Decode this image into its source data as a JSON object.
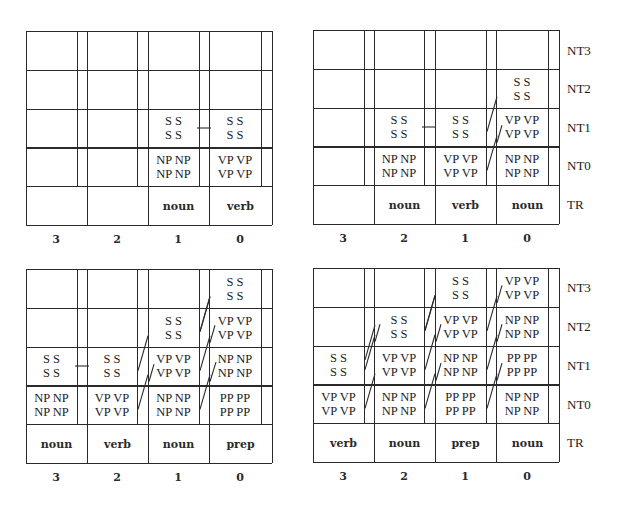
{
  "row_labels": [
    "NT3",
    "NT2",
    "NT1",
    "NT0",
    "TR"
  ],
  "column_labels": [
    "3",
    "2",
    "1",
    "0"
  ],
  "panels": [
    {
      "id": "top-left",
      "terminals": [
        "",
        "",
        "noun",
        "verb"
      ],
      "cells": {
        "NT3": [
          "",
          "",
          "",
          ""
        ],
        "NT2": [
          "",
          "",
          "",
          ""
        ],
        "NT1": [
          "",
          "",
          "S S\nS S",
          "S S\nS S"
        ],
        "NT0": [
          "",
          "",
          "NP NP\nNP NP",
          "VP VP\nVP VP"
        ]
      },
      "connectors": [
        {
          "type": "dash",
          "row": "NT1",
          "gap": 2
        }
      ]
    },
    {
      "id": "top-right",
      "terminals": [
        "",
        "noun",
        "verb",
        "noun"
      ],
      "cells": {
        "NT3": [
          "",
          "",
          "",
          ""
        ],
        "NT2": [
          "",
          "",
          "",
          "S S\nS S"
        ],
        "NT1": [
          "",
          "S S\nS S",
          "S S\nS S",
          "VP VP\nVP VP"
        ],
        "NT0": [
          "",
          "NP NP\nNP NP",
          "VP VP\nVP VP",
          "NP NP\nNP NP"
        ]
      },
      "connectors": [
        {
          "type": "dash",
          "row": "NT1",
          "gap": 1
        },
        {
          "type": "slash",
          "row": "NT0",
          "gap": 2
        },
        {
          "type": "slash",
          "row": "NT1",
          "gap": 2
        },
        {
          "type": "slash-into",
          "row": "NT1",
          "gap": 3
        },
        {
          "type": "slash-into",
          "row": "NT0",
          "gap": 3
        }
      ]
    },
    {
      "id": "bottom-left",
      "terminals": [
        "noun",
        "verb",
        "noun",
        "prep"
      ],
      "cells": {
        "NT3": [
          "",
          "",
          "",
          "S S\nS S"
        ],
        "NT2": [
          "",
          "",
          "S S\nS S",
          "VP VP\nVP VP"
        ],
        "NT1": [
          "S S\nS S",
          "S S\nS S",
          "VP VP\nVP VP",
          "NP NP\nNP NP"
        ],
        "NT0": [
          "NP NP\nNP NP",
          "VP VP\nVP VP",
          "NP NP\nNP NP",
          "PP PP\nPP PP"
        ]
      },
      "connectors": [
        {
          "type": "dash",
          "row": "NT1",
          "gap": 0
        }
      ]
    },
    {
      "id": "bottom-right",
      "terminals": [
        "verb",
        "noun",
        "prep",
        "noun"
      ],
      "cells": {
        "NT3": [
          "",
          "",
          "S S\nS S",
          "VP VP\nVP VP"
        ],
        "NT2": [
          "",
          "S S\nS S",
          "VP VP\nVP VP",
          "NP NP\nNP NP"
        ],
        "NT1": [
          "S S\nS S",
          "VP VP\nVP VP",
          "NP NP\nNP NP",
          "PP PP\nPP PP"
        ],
        "NT0": [
          "VP VP\nVP VP",
          "NP NP\nNP NP",
          "PP PP\nPP PP",
          "NP NP\nNP NP"
        ]
      },
      "connectors": []
    }
  ],
  "colors": {
    "line": "#2a2a2a",
    "text": "#1c1c1c",
    "background": "#ffffff"
  }
}
